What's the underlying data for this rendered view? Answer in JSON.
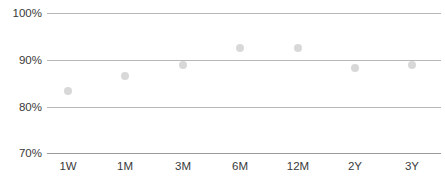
{
  "chart_data": {
    "type": "scatter",
    "title": "",
    "subtitle": "",
    "xlabel": "",
    "ylabel": "",
    "categories": [
      "1W",
      "1M",
      "3M",
      "6M",
      "12M",
      "2Y",
      "3Y"
    ],
    "values": [
      83.4,
      86.5,
      88.8,
      92.6,
      92.6,
      88.3,
      88.8
    ],
    "series": [
      {
        "name": "",
        "values": [
          83.4,
          86.5,
          88.8,
          92.6,
          92.6,
          88.3,
          88.8
        ]
      }
    ],
    "ylim": [
      70,
      100
    ],
    "yticks": [
      70,
      80,
      90,
      100
    ],
    "ytick_labels": [
      "70%",
      "80%",
      "90%",
      "100%"
    ],
    "grid": true,
    "legend": "none",
    "point_color": "#d8d8d8",
    "gridline_color": "#b7b7b7",
    "axis_color": "#9a9a9a",
    "tick_text_color": "#3a3a3a"
  },
  "axes": {
    "y": {
      "ticks": [
        {
          "label": "100%",
          "value": 100
        },
        {
          "label": "90%",
          "value": 90
        },
        {
          "label": "80%",
          "value": 80
        },
        {
          "label": "70%",
          "value": 70
        }
      ]
    },
    "x": {
      "ticks": [
        {
          "label": "1W"
        },
        {
          "label": "1M"
        },
        {
          "label": "3M"
        },
        {
          "label": "6M"
        },
        {
          "label": "12M"
        },
        {
          "label": "2Y"
        },
        {
          "label": "3Y"
        }
      ]
    }
  },
  "footer": {
    "clipped_text": ""
  }
}
